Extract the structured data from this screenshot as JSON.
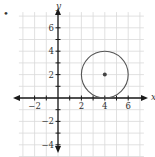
{
  "figure": {
    "bullet": "•",
    "x_axis_label": "x",
    "y_axis_label": "y",
    "x_tick_labels": [
      {
        "value": -2,
        "label": "−2"
      },
      {
        "value": 2,
        "label": "2"
      },
      {
        "value": 4,
        "label": "4"
      },
      {
        "value": 6,
        "label": "6"
      }
    ],
    "y_tick_labels": [
      {
        "value": 6,
        "label": "6"
      },
      {
        "value": 4,
        "label": "4"
      },
      {
        "value": 2,
        "label": "2"
      },
      {
        "value": -2,
        "label": "−2"
      },
      {
        "value": -4,
        "label": "−4"
      }
    ],
    "grid": {
      "xmin": -3,
      "xmax": 7,
      "ymin": -5,
      "ymax": 7,
      "step": 1
    },
    "circle": {
      "center": [
        4,
        2
      ],
      "radius": 2
    },
    "colors": {
      "grid": "#d9d9d9",
      "axis": "#1a1a1a",
      "circle": "#555555",
      "point": "#444444"
    }
  }
}
